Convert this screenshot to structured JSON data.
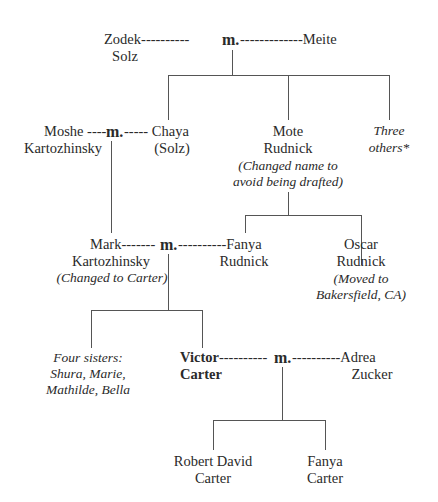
{
  "marriage_label": "m.",
  "gen1": {
    "husband": {
      "line1": "Zodek",
      "line2": "Solz",
      "dashes_left": "----------"
    },
    "wife": {
      "line1": "Meite",
      "dashes_right": "-------------"
    }
  },
  "gen2": {
    "moshe": {
      "line1": "Moshe",
      "line2": "Kartozhinsky",
      "dashes": "----"
    },
    "chaya": {
      "line1": "Chaya",
      "line2": "(Solz)",
      "dashes": "-----"
    },
    "mote": {
      "line1": "Mote",
      "line2": "Rudnick",
      "note1": "(Changed name to",
      "note2": "avoid being drafted)"
    },
    "others": {
      "line1": "Three",
      "line2": "others*"
    }
  },
  "gen3": {
    "mark": {
      "line1": "Mark",
      "line2": "Kartozhinsky",
      "note": "(Changed to Carter)",
      "dashes": "-------"
    },
    "fanya": {
      "line1": "Fanya",
      "line2": "Rudnick",
      "dashes": "----------"
    },
    "oscar": {
      "line1": "Oscar",
      "line2": "Rudnick",
      "note1": "(Moved to",
      "note2": "Bakersfield, CA)"
    }
  },
  "gen4": {
    "sisters": {
      "line1": "Four sisters:",
      "line2": "Shura, Marie,",
      "line3": "Mathilde, Bella"
    },
    "victor": {
      "line1": "Victor",
      "line2": "Carter",
      "dashes": "----------"
    },
    "adrea": {
      "line1": "Adrea",
      "line2": "Zucker",
      "dashes": "----------"
    }
  },
  "gen5": {
    "robert": {
      "line1": "Robert David",
      "line2": "Carter"
    },
    "fanya": {
      "line1": "Fanya",
      "line2": "Carter"
    }
  }
}
